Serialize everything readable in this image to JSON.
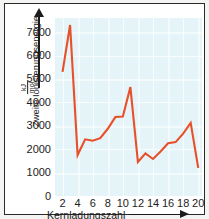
{
  "chart_data": {
    "type": "line",
    "title": "",
    "xlabel": "Kernladungszahl",
    "ylabel": "Zweite Ionisierungsenergie",
    "yunit_numerator": "kJ",
    "yunit_denominator": "mol",
    "xlim": [
      1,
      20.5
    ],
    "ylim": [
      0,
      7600
    ],
    "grid": true,
    "legend": "none",
    "xticks": [
      2,
      4,
      6,
      8,
      10,
      12,
      14,
      16,
      18,
      20
    ],
    "yticks": [
      0,
      1000,
      2000,
      3000,
      4000,
      5000,
      6000,
      7000
    ],
    "x": [
      2,
      3,
      4,
      5,
      6,
      7,
      8,
      9,
      10,
      11,
      12,
      13,
      14,
      15,
      16,
      17,
      18,
      19,
      20
    ],
    "values": [
      5300,
      7300,
      1750,
      2420,
      2360,
      2470,
      2870,
      3370,
      3390,
      4650,
      1450,
      1820,
      1580,
      1900,
      2250,
      2300,
      2660,
      3120,
      1200
    ],
    "series_color": "#e8502a",
    "plot_background": "#e4f4f8",
    "axis_color": "#1c1c1c",
    "x_arrow_icon": "arrow-right-icon",
    "y_arrow_icon": "arrow-up-icon"
  }
}
